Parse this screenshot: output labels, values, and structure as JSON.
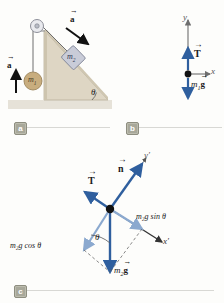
{
  "figure": {
    "type": "physics-free-body-diagram"
  },
  "colors": {
    "vector_blue": "#2f5f9e",
    "vector_blue_light": "#8ba9cf",
    "axis_gray": "#6e6e6e",
    "incline_fill": "#ded6c4",
    "incline_edge": "#b8ae99",
    "ground": "#e6e2d8",
    "mass_tan": "#c8ad7e",
    "mass_block": "#c9ccd8",
    "badge_bg": "#a8a89a",
    "rule": "#d8d8d4",
    "black": "#111111"
  },
  "panels": [
    {
      "id": "a",
      "badge": "a",
      "labels": {
        "accel_left": "a",
        "accel_right": "a",
        "mass1": "m",
        "mass1_sub": "1",
        "mass2": "m",
        "mass2_sub": "2",
        "angle": "θ"
      },
      "geometry": {
        "incline_angle_deg": 30,
        "accel_left_direction": "up",
        "accel_right_direction": "down-right-along-incline"
      }
    },
    {
      "id": "b",
      "badge": "b",
      "labels": {
        "y_axis": "y",
        "x_axis": "x",
        "tension": "T",
        "weight": "m",
        "weight_sub": "1",
        "weight_rest": "g"
      },
      "geometry": {
        "tension_direction": "up",
        "weight_direction": "down"
      }
    },
    {
      "id": "c",
      "badge": "c",
      "labels": {
        "y_prime": "y′",
        "x_prime": "x′",
        "normal": "n",
        "tension": "T",
        "weight": "m",
        "weight_sub": "2",
        "weight_rest": "g",
        "component_sin": "m₂g sin θ",
        "component_cos": "m₂g cos θ",
        "angle": "θ"
      },
      "geometry": {
        "normal_direction": "perpendicular-to-incline",
        "tension_direction": "up-the-incline",
        "weight_direction": "straight-down",
        "incline_angle_deg": 30
      }
    }
  ]
}
